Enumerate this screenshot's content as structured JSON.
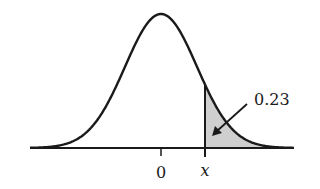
{
  "chart_data": {
    "type": "area",
    "title": "",
    "xlabel": "",
    "ylabel": "",
    "distribution": "normal",
    "mean": 0,
    "tick_labels": [
      "0",
      "x"
    ],
    "shaded_region": {
      "from": "x",
      "to": "+inf",
      "area": 0.23
    },
    "annotation": {
      "text": "0.23",
      "points_to": "shaded_region"
    },
    "grid": false,
    "legend": null
  },
  "labels": {
    "area_value": "0.23",
    "tick_zero": "0",
    "tick_x": "x"
  },
  "colors": {
    "curve": "#1a1a1a",
    "shade": "#cfcfcf",
    "axis": "#1a1a1a"
  }
}
